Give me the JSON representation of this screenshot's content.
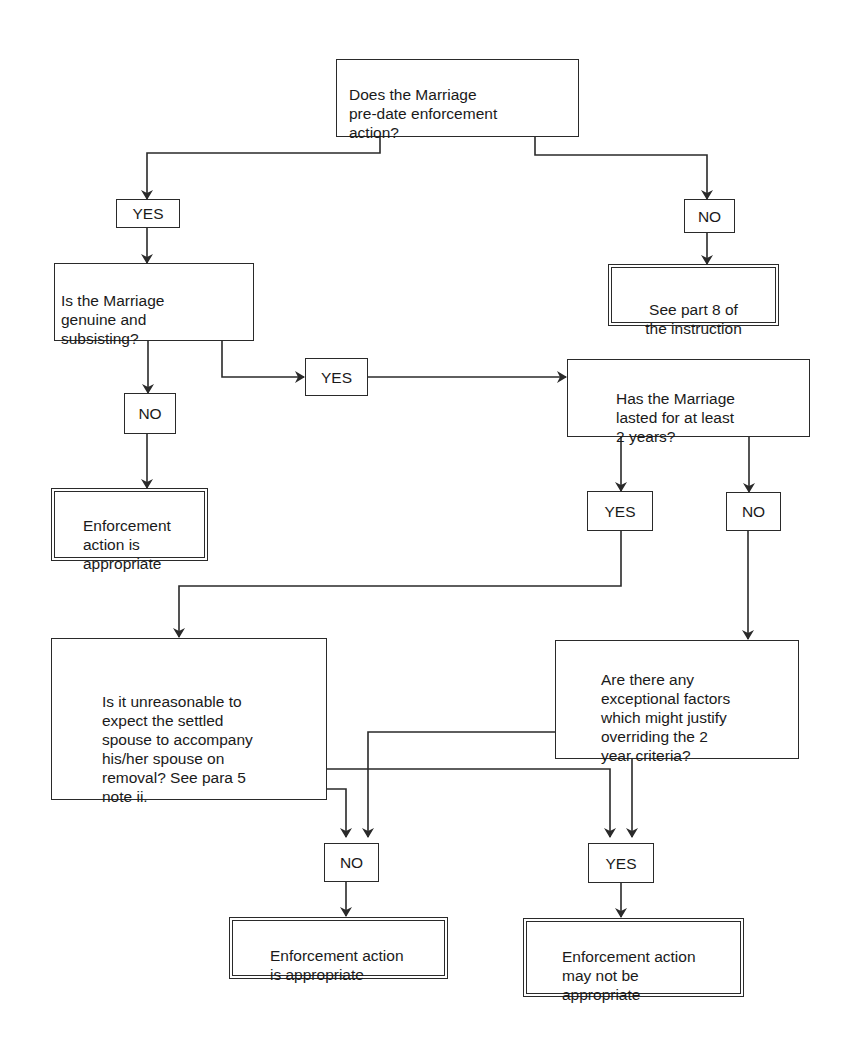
{
  "diagram": {
    "type": "flowchart",
    "colors": {
      "line": "#2a2a2a",
      "background": "#ffffff",
      "text": "#1a1a1a"
    },
    "nodes": {
      "q1": {
        "text": "Does the Marriage\npre-date enforcement\naction?"
      },
      "yes1": {
        "text": "YES"
      },
      "no1": {
        "text": "NO"
      },
      "end_part8": {
        "text": "See part 8 of\nthe instruction"
      },
      "q2": {
        "text": "Is the Marriage\ngenuine and\nsubsisting?"
      },
      "no2": {
        "text": "NO"
      },
      "end_enforce1": {
        "text": "Enforcement\naction is\nappropriate"
      },
      "yes2": {
        "text": "YES"
      },
      "q3": {
        "text": "Has the Marriage\nlasted for at least\n2 years?"
      },
      "yes3": {
        "text": "YES"
      },
      "no3": {
        "text": "NO"
      },
      "q4": {
        "text": "Is it unreasonable to\nexpect the settled\nspouse to accompany\nhis/her spouse on\nremoval? See para 5\nnote ii."
      },
      "q5": {
        "text": "Are there any\nexceptional factors\nwhich might justify\noverriding the 2\nyear criteria?"
      },
      "no_final": {
        "text": "NO"
      },
      "yes_final": {
        "text": "YES"
      },
      "end_enforce2": {
        "text": "Enforcement action\nis appropriate"
      },
      "end_maynot": {
        "text": "Enforcement action\nmay not be\nappropriate"
      }
    },
    "edges": [
      {
        "from": "q1",
        "to": "yes1"
      },
      {
        "from": "q1",
        "to": "no1"
      },
      {
        "from": "no1",
        "to": "end_part8"
      },
      {
        "from": "yes1",
        "to": "q2"
      },
      {
        "from": "q2",
        "to": "no2"
      },
      {
        "from": "no2",
        "to": "end_enforce1"
      },
      {
        "from": "q2",
        "to": "yes2"
      },
      {
        "from": "yes2",
        "to": "q3"
      },
      {
        "from": "q3",
        "to": "yes3"
      },
      {
        "from": "q3",
        "to": "no3"
      },
      {
        "from": "yes3",
        "to": "q4"
      },
      {
        "from": "no3",
        "to": "q5"
      },
      {
        "from": "q4",
        "to": "no_final"
      },
      {
        "from": "q4",
        "to": "yes_final"
      },
      {
        "from": "q5",
        "to": "no_final"
      },
      {
        "from": "q5",
        "to": "yes_final"
      },
      {
        "from": "no_final",
        "to": "end_enforce2"
      },
      {
        "from": "yes_final",
        "to": "end_maynot"
      }
    ]
  }
}
